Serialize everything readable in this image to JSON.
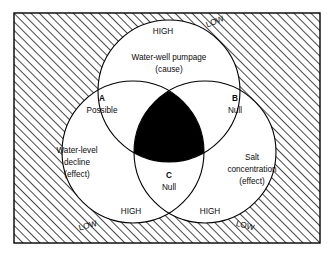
{
  "figure": {
    "kind": "venn-diagram",
    "set_count": 3,
    "frame": {
      "border_color": "#000000",
      "hatch_color": "#1a1a1a",
      "background": "#ffffff"
    },
    "intersection_fill": "#000000"
  },
  "circles": {
    "top": {
      "name": "water-well-pumpage",
      "line1": "Water-well pumpage",
      "line2": "(cause)",
      "role": "cause",
      "high_label": "HIGH",
      "low_label": "LOW"
    },
    "left": {
      "name": "water-level-decline",
      "line1": "Water-level",
      "line2": "decline",
      "line3": "(effect)",
      "role": "effect",
      "high_label": "HIGH",
      "low_label": "LOW"
    },
    "right": {
      "name": "salt-concentration",
      "line1": "Salt",
      "line2": "concentration",
      "line3": "(effect)",
      "role": "effect",
      "high_label": "HIGH",
      "low_label": "LOW"
    }
  },
  "regions": [
    {
      "letter": "A",
      "value": "Possible"
    },
    {
      "letter": "B",
      "value": "Null"
    },
    {
      "letter": "C",
      "value": "Null"
    }
  ]
}
